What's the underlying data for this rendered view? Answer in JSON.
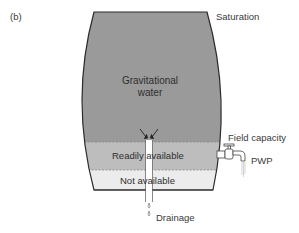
{
  "figure": {
    "panel_label": "(b)"
  },
  "zones": {
    "gravitational": {
      "label_line1": "Gravitational",
      "label_line2": "water",
      "color": "#9a9a9a"
    },
    "readily_available": {
      "label": "Readily available",
      "color": "#bdbdbd"
    },
    "not_available": {
      "label": "Not available",
      "color": "#ececec"
    }
  },
  "annotations": {
    "saturation": "Saturation",
    "field_capacity": "Field capacity",
    "pwp": "PWP",
    "drainage": "Drainage"
  },
  "colors": {
    "outline": "#2b2b2b",
    "text": "#3a3a3a",
    "dashed_line": "#888888"
  }
}
